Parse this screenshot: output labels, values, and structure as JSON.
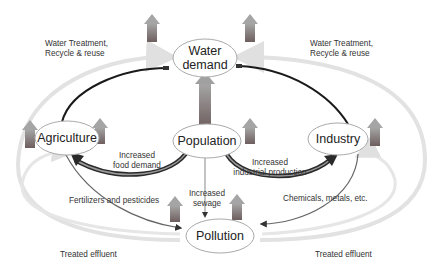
{
  "nodes": {
    "water_demand": {
      "line1": "Water",
      "line2": "demand"
    },
    "agriculture": {
      "label": "Agriculture"
    },
    "population": {
      "label": "Population"
    },
    "industry": {
      "label": "Industry"
    },
    "pollution": {
      "label": "Pollution"
    }
  },
  "labels": {
    "treatment_left_1": "Water Treatment,",
    "treatment_left_2": "Recycle & reuse",
    "treatment_right_1": "Water Treatment,",
    "treatment_right_2": "Recycle & reuse",
    "food_1": "Increased",
    "food_2": "food demand",
    "industrial_1": "Increased",
    "industrial_2": "industrial production",
    "sewage_1": "Increased",
    "sewage_2": "sewage",
    "fertilizers": "Fertilizers and pesticides",
    "chemicals": "Chemicals, metals, etc.",
    "effluent_left": "Treated effluent",
    "effluent_right": "Treated effluent"
  },
  "colors": {
    "up_arrow_top": "#9a9a9a",
    "up_arrow_bottom": "#6a5a5a",
    "cycle_outline": "#dcdcdc",
    "dark_arrow": "#1a1a1a"
  }
}
